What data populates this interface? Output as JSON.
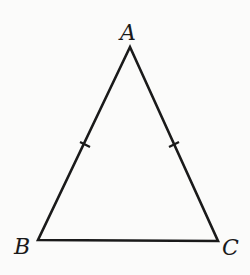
{
  "diagram": {
    "type": "isosceles-triangle",
    "vertices": {
      "A": {
        "label": "A",
        "x": 130,
        "y": 47
      },
      "B": {
        "label": "B",
        "x": 38,
        "y": 240
      },
      "C": {
        "label": "C",
        "x": 218,
        "y": 241
      }
    },
    "equal_sides": [
      "AB",
      "AC"
    ],
    "tick_marks": [
      {
        "side": "AB",
        "x": 85,
        "y": 145
      },
      {
        "side": "AC",
        "x": 174,
        "y": 145
      }
    ],
    "stroke_color": "#1a1a1a"
  }
}
